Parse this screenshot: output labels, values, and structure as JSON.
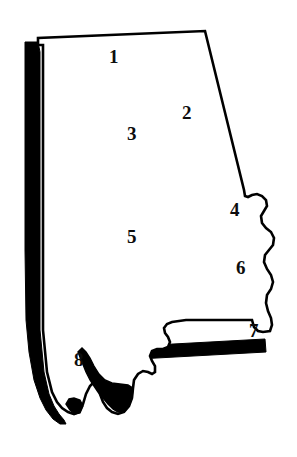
{
  "figure": {
    "kind": "outline-map",
    "width": 297,
    "height": 457,
    "background_color": "#ffffff",
    "outline_color": "#000000",
    "shadow_color": "#000000",
    "label_color": "#0d0d0d"
  },
  "labels": [
    {
      "id": "region-1",
      "text": "1",
      "x": 109,
      "y": 47
    },
    {
      "id": "region-2",
      "text": "2",
      "x": 182,
      "y": 103
    },
    {
      "id": "region-3",
      "text": "3",
      "x": 127,
      "y": 124
    },
    {
      "id": "region-4",
      "text": "4",
      "x": 230,
      "y": 200
    },
    {
      "id": "region-5",
      "text": "5",
      "x": 127,
      "y": 227
    },
    {
      "id": "region-6",
      "text": "6",
      "x": 236,
      "y": 258
    },
    {
      "id": "region-7",
      "text": "7",
      "x": 249,
      "y": 321
    },
    {
      "id": "region-8",
      "text": "8",
      "x": 74,
      "y": 350
    }
  ],
  "shapes": {
    "state_outline": "M 38 38 L 38 45 L 43 45 L 43 330 L 47 372 L 52 392 L 57 402 L 62 408 L 68 412 L 74 414 L 79 412 L 83 404 L 86 394 L 90 386 L 94 382 L 98 386 L 100 394 L 103 402 L 107 408 L 112 412 L 118 414 L 124 412 L 129 406 L 132 398 L 133 388 L 134 380 L 138 374 L 143 371 L 148 372 L 152 374 L 155 372 L 155 366 L 152 361 L 150 356 L 152 351 L 157 349 L 163 349 L 168 347 L 170 342 L 168 337 L 165 333 L 164 328 L 167 324 L 172 322 L 179 321 L 186 320 L 194 320 L 230 320 L 252 320 L 254 327 L 258 331 L 263 332 L 270 331 L 272 325 L 271 318 L 268 311 L 266 303 L 267 295 L 271 289 L 273 282 L 271 275 L 267 269 L 264 262 L 265 255 L 269 250 L 273 245 L 274 238 L 271 232 L 266 228 L 262 223 L 261 216 L 264 211 L 267 206 L 266 200 L 262 196 L 257 194 L 252 195 L 248 197 L 245 196 L 244 190 L 205 31 L 38 38 Z",
    "west_shadow": "M 25 42 L 38 42 L 40 52 L 40 330 L 44 372 L 49 394 L 54 406 L 59 414 L 64 420 L 66 424 L 60 424 L 53 419 L 46 410 L 40 398 L 34 380 L 29 352 L 26 320 L 25 250 L 25 42 Z",
    "south_shadow": "M 100 348 L 265 339 L 266 352 L 102 361 L 100 348 Z",
    "bay_fill": "M 78 352 L 82 362 L 86 372 L 90 380 L 94 386 L 98 392 L 103 398 L 108 404 L 113 409 L 118 412 L 124 412 L 129 406 L 132 398 L 133 388 L 128 385 L 120 384 L 112 383 L 105 380 L 99 374 L 94 366 L 90 358 L 86 352 L 82 348 L 78 352 Z",
    "bay_lobe": "M 66 404 L 70 410 L 75 414 L 80 413 L 83 406 L 80 400 L 74 398 L 69 399 L 66 404 Z"
  }
}
